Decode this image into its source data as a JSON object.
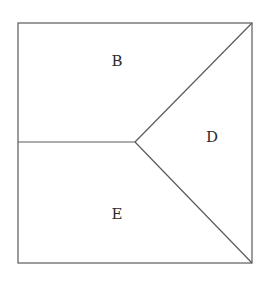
{
  "diagram": {
    "type": "partitioned-square",
    "colors": {
      "line": "#5a5a5a",
      "text": "#2a2a2a",
      "background": "#ffffff"
    },
    "square": {
      "x1": 18,
      "y1": 23,
      "x2": 252,
      "y2": 263
    },
    "apex": {
      "x": 135,
      "y": 142
    },
    "edges": [
      {
        "from": [
          18,
          142
        ],
        "to": [
          135,
          142
        ]
      },
      {
        "from": [
          135,
          142
        ],
        "to": [
          252,
          23
        ]
      },
      {
        "from": [
          135,
          142
        ],
        "to": [
          252,
          263
        ]
      }
    ],
    "regions": [
      {
        "label": "B",
        "x": 117,
        "y": 66
      },
      {
        "label": "D",
        "x": 212,
        "y": 142
      },
      {
        "label": "E",
        "x": 117,
        "y": 219
      }
    ]
  }
}
